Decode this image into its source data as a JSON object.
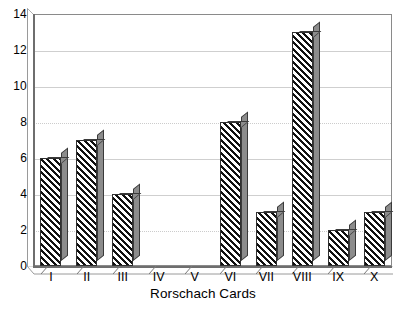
{
  "chart_data": {
    "type": "bar",
    "title": "",
    "subtitle": "",
    "xlabel": "Rorschach Cards",
    "ylabel": "",
    "categories": [
      "I",
      "II",
      "III",
      "IV",
      "V",
      "VI",
      "VII",
      "VIII",
      "IX",
      "X"
    ],
    "values": [
      6,
      7,
      4,
      0,
      0,
      8,
      3,
      13,
      2,
      3
    ],
    "ylim": [
      0,
      14
    ],
    "yticks": [
      0,
      2,
      4,
      6,
      8,
      10,
      12,
      14
    ],
    "ytick_labels": [
      "0",
      "2",
      "4",
      "6",
      "8",
      "10",
      "12",
      "14"
    ],
    "grid": true,
    "grid_axis": "y",
    "legend": null,
    "legend_position": "none",
    "style": "3d-hatched-bars",
    "bar_fill": "diagonal-hatch",
    "colors": {
      "bar_hatch": "#111111",
      "bar_face": "#ffffff",
      "bar_side": "#8c8c8c",
      "bar_outline": "#303030",
      "gridline": "#cfcfcf",
      "axis": "#6e6e6e",
      "text": "#000000",
      "background": "#ffffff"
    }
  },
  "axis": {
    "x_title": "Rorschach Cards"
  },
  "caption": {
    "fragment": ""
  }
}
